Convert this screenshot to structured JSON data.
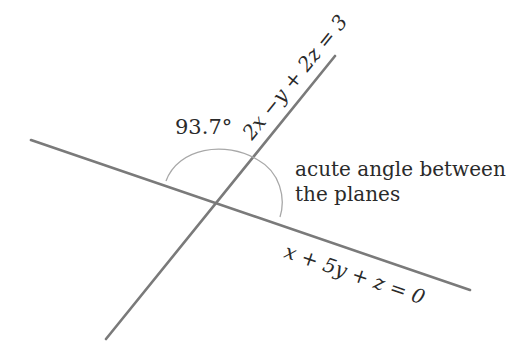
{
  "diagram": {
    "plane1": {
      "equation": "2x −y + 2z = 3"
    },
    "plane2": {
      "equation": "x + 5y + z = 0"
    },
    "angle": {
      "value": "93.7°"
    },
    "annotation": {
      "line1": "acute angle between",
      "line2": "the planes"
    }
  },
  "colors": {
    "line": "#7a7a7a",
    "arc": "#a8a8a8",
    "text": "#2a2a2a"
  }
}
